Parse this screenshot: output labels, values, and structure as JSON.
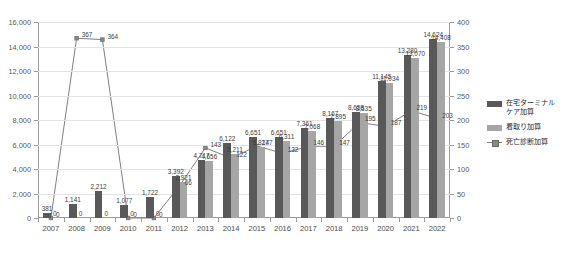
{
  "chart_data": {
    "type": "bar",
    "title": "",
    "subtitle": "",
    "xlabel": "",
    "ylabel": "",
    "grid": true,
    "legend_position": "right",
    "categories": [
      "2007",
      "2008",
      "2009",
      "2010",
      "2011",
      "2012",
      "2013",
      "2014",
      "2015",
      "2016",
      "2017",
      "2018",
      "2019",
      "2020",
      "2021",
      "2022"
    ],
    "ylim": [
      0,
      16000
    ],
    "yticks": [
      "0",
      "2,000",
      "4,000",
      "6,000",
      "8,000",
      "10,000",
      "12,000",
      "14,000",
      "16,000"
    ],
    "ylim_secondary": [
      0,
      400
    ],
    "yticks_secondary": [
      "0",
      "50",
      "100",
      "150",
      "200",
      "250",
      "300",
      "350",
      "400"
    ],
    "series": [
      {
        "name": "在宅ターミナルケア加算",
        "axis": "left",
        "kind": "bar",
        "color": "#595959",
        "values": [
          381,
          1141,
          2212,
          1077,
          1722,
          3392,
          4717,
          6122,
          6651,
          6651,
          7361,
          8167,
          8658,
          11145,
          13280,
          14624
        ],
        "labels": [
          "381",
          "1,141",
          "2,212",
          "1,077",
          "1,722",
          "3,392",
          "4,717",
          "6,122",
          "6,651",
          "6,651",
          "7,361",
          "8,167",
          "8,658",
          "11,145",
          "13,280",
          "14,624"
        ]
      },
      {
        "name": "看取り加算",
        "axis": "left",
        "kind": "bar",
        "color": "#a6a6a6",
        "values": [
          0,
          0,
          0,
          0,
          0,
          2921,
          4656,
          5211,
          5827,
          6311,
          7068,
          7895,
          8535,
          11034,
          13070,
          14408
        ],
        "labels": [
          "0",
          "0",
          "0",
          "0",
          "0",
          "2,921",
          "4,656",
          "5,211",
          "5,827",
          "6,311",
          "7,068",
          "7,895",
          "8,535",
          "11,034",
          "13,070",
          "14,408"
        ]
      },
      {
        "name": "死亡診断加算",
        "axis": "right",
        "kind": "line",
        "color": "#7f7f7f",
        "values": [
          0,
          367,
          364,
          0,
          0,
          66,
          143,
          122,
          147,
          132,
          146,
          147,
          195,
          187,
          219,
          203
        ],
        "labels": [
          "0",
          "367",
          "364",
          "0",
          "0",
          "66",
          "143",
          "122",
          "147",
          "132",
          "146",
          "147",
          "195",
          "187",
          "219",
          "203"
        ]
      }
    ]
  },
  "legend": {
    "items": [
      {
        "label": "在宅ターミナル\nケア加算",
        "type": "bar",
        "color": "#595959"
      },
      {
        "label": "看取り加算",
        "type": "bar",
        "color": "#a6a6a6"
      },
      {
        "label": "死亡診断加算",
        "type": "line",
        "color": "#7f7f7f"
      }
    ]
  }
}
